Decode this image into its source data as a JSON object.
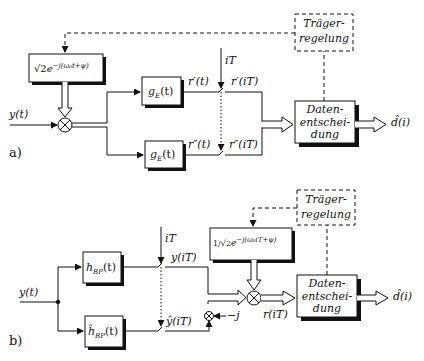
{
  "diagram": {
    "title": "",
    "colors": {
      "line": "#111111",
      "shadow": "#111111",
      "background": "#ffffff"
    },
    "panel_a": {
      "panel_label": "a)",
      "input_label": "y(t)",
      "oscillator_label": "√2e^{−j(ω₀t+ψ)}",
      "oscillator_sqrt": "√2",
      "oscillator_exp": "e",
      "oscillator_sup": "−j(ω₀t+ψ)",
      "mixer": "multiplier-icon",
      "filter_upper": {
        "name": "g",
        "sub": "E",
        "arg": "(t)"
      },
      "filter_lower": {
        "name": "g",
        "sub": "E",
        "arg": "(t)"
      },
      "signal_upper": "r′(t)",
      "signal_lower": "r″(t)",
      "sampler_label": "iT",
      "sampled_upper": "r′(iT)",
      "sampled_lower": "r″(iT)",
      "carrier_control": {
        "line1": "Träger-",
        "line2": "regelung"
      },
      "decision": {
        "line1": "Daten-",
        "line2": "entschei-",
        "line3": "dung"
      },
      "output_label": "d̂(i)"
    },
    "panel_b": {
      "panel_label": "b)",
      "input_label": "y(t)",
      "filter_upper": {
        "name": "h",
        "sub": "BP",
        "arg": "(t)"
      },
      "filter_lower": {
        "name": "ĥ",
        "sub": "BP",
        "arg": "(t)"
      },
      "sampler_label": "iT",
      "sampled_upper": "y(iT)",
      "sampled_lower": "ŷ(iT)",
      "j_multiplier_label": "−j",
      "oscillator_frac": "1/√2",
      "oscillator_exp": "e",
      "oscillator_sup": "−j(ω₀iT+ψ)",
      "mixer_output": "r(iT)",
      "carrier_control": {
        "line1": "Träger-",
        "line2": "regelung"
      },
      "decision": {
        "line1": "Daten-",
        "line2": "entschei-",
        "line3": "dung"
      },
      "output_label": "d̂(i)"
    }
  }
}
